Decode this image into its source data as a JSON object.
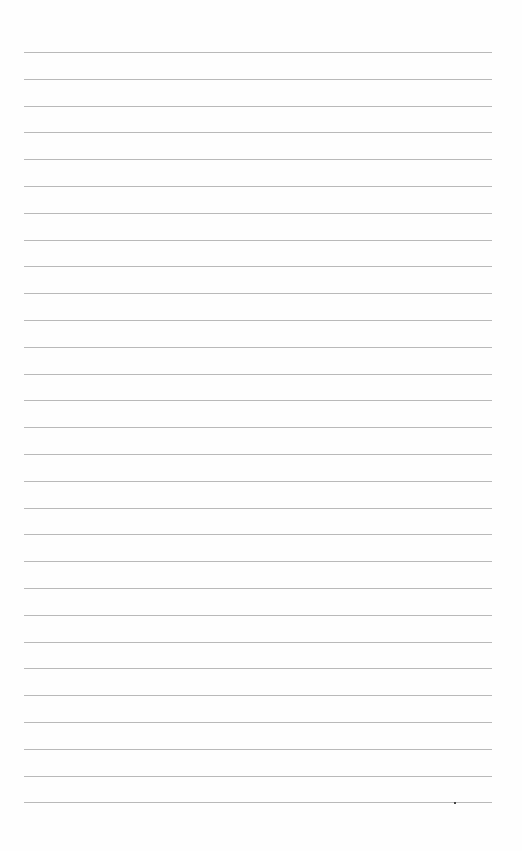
{
  "page": {
    "type": "blank lined paper",
    "line_count": 29,
    "first_line_y": 52,
    "line_spacing": 26.8,
    "line_left": 24,
    "line_width": 468,
    "line_color": "#b9b9b9",
    "background_color": "#fefefe",
    "marks": [
      {
        "x": 454,
        "y": 802
      }
    ]
  }
}
